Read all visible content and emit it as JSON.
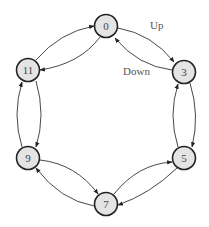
{
  "diagram": {
    "type": "cyclic state transition diagram",
    "nodes": [
      {
        "id": "0",
        "label": "0",
        "x": 106,
        "y": 26
      },
      {
        "id": "3",
        "label": "3",
        "x": 184,
        "y": 72
      },
      {
        "id": "5",
        "label": "5",
        "x": 184,
        "y": 158
      },
      {
        "id": "7",
        "label": "7",
        "x": 106,
        "y": 204
      },
      {
        "id": "9",
        "label": "9",
        "x": 28,
        "y": 158
      },
      {
        "id": "11",
        "label": "11",
        "x": 28,
        "y": 70
      }
    ],
    "edge_labels": {
      "up": "Up",
      "down": "Down"
    },
    "edges": [
      {
        "from": "0",
        "to": "3",
        "direction": "up"
      },
      {
        "from": "3",
        "to": "0",
        "direction": "down"
      },
      {
        "from": "3",
        "to": "5",
        "direction": "up"
      },
      {
        "from": "5",
        "to": "3",
        "direction": "down"
      },
      {
        "from": "5",
        "to": "7",
        "direction": "up"
      },
      {
        "from": "7",
        "to": "5",
        "direction": "down"
      },
      {
        "from": "7",
        "to": "9",
        "direction": "up"
      },
      {
        "from": "9",
        "to": "7",
        "direction": "down"
      },
      {
        "from": "9",
        "to": "11",
        "direction": "up"
      },
      {
        "from": "11",
        "to": "9",
        "direction": "down"
      },
      {
        "from": "11",
        "to": "0",
        "direction": "up"
      },
      {
        "from": "0",
        "to": "11",
        "direction": "down"
      }
    ]
  }
}
